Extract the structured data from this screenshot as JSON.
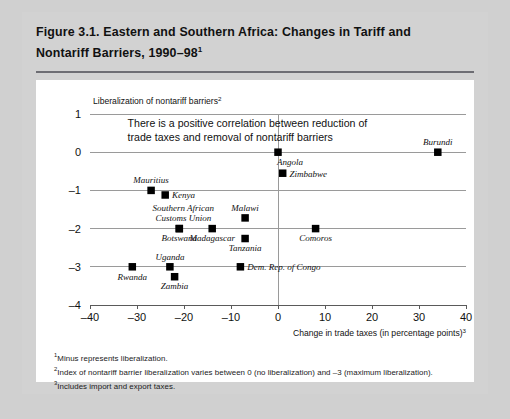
{
  "figure": {
    "title_line1": "Figure 3.1.  Eastern and Southern Africa:  Changes in Tariff and",
    "title_line2": "Nontariff Barriers, 1990–98",
    "title_superscript": "1"
  },
  "annotation": {
    "line1": "There is a positive correlation between reduction of",
    "line2": "trade taxes and removal of nontariff barriers"
  },
  "footnotes": [
    {
      "marker": "1",
      "text": "Minus represents liberalization."
    },
    {
      "marker": "2",
      "text": "Index of nontariff barrier liberalization varies between 0 (no liberalization) and –3 (maximum liberalization)."
    },
    {
      "marker": "3",
      "text": "Includes import and export taxes."
    }
  ],
  "chart_data": {
    "type": "scatter",
    "title": "Figure 3.1. Eastern and Southern Africa: Changes in Tariff and Nontariff Barriers, 1990–98",
    "xlabel": "Change in trade taxes (in percentage points)",
    "xlabel_superscript": "3",
    "ylabel": "Liberalization of nontariff barriers",
    "ylabel_superscript": "2",
    "xlim": [
      -40,
      40
    ],
    "ylim": [
      -4,
      1
    ],
    "xticks": [
      -40,
      -30,
      -20,
      -10,
      0,
      10,
      20,
      30,
      40
    ],
    "xticklabels": [
      "–40",
      "–30",
      "–20",
      "–10",
      "0",
      "10",
      "20",
      "30",
      "40"
    ],
    "yticks": [
      1,
      0,
      -1,
      -2,
      -3,
      -4
    ],
    "yticklabels": [
      "1",
      "0",
      "–1",
      "–2",
      "–3",
      "–4"
    ],
    "grid": "horizontal",
    "legend": "none",
    "marker_color": "#000000",
    "points": [
      {
        "name": "Burundi",
        "x": 34,
        "y": 0,
        "label_pos": "above"
      },
      {
        "name": "Angola",
        "x": 0,
        "y": 0,
        "label_pos": "below-right"
      },
      {
        "name": "Zimbabwe",
        "x": 1,
        "y": -0.55,
        "label_pos": "right"
      },
      {
        "name": "Mauritius",
        "x": -27,
        "y": -1,
        "label_pos": "above"
      },
      {
        "name": "Kenya",
        "x": -24,
        "y": -1.12,
        "label_pos": "right"
      },
      {
        "name": "Southern African Customs Union",
        "x": -21,
        "y": -2,
        "label_pos": "above"
      },
      {
        "name": "Botswana",
        "x": -21,
        "y": -2,
        "label_pos": "below"
      },
      {
        "name": "Madagascar",
        "x": -14,
        "y": -2,
        "label_pos": "below"
      },
      {
        "name": "Malawi",
        "x": -7,
        "y": -1.72,
        "label_pos": "above"
      },
      {
        "name": "Tanzania",
        "x": -7,
        "y": -2.26,
        "label_pos": "below"
      },
      {
        "name": "Comoros",
        "x": 8,
        "y": -2,
        "label_pos": "below"
      },
      {
        "name": "Rwanda",
        "x": -31,
        "y": -3,
        "label_pos": "below"
      },
      {
        "name": "Uganda",
        "x": -23,
        "y": -3,
        "label_pos": "above"
      },
      {
        "name": "Zambia",
        "x": -22,
        "y": -3.26,
        "label_pos": "below"
      },
      {
        "name": "Dem. Rep. of Congo",
        "x": -8,
        "y": -3,
        "label_pos": "right"
      }
    ]
  }
}
